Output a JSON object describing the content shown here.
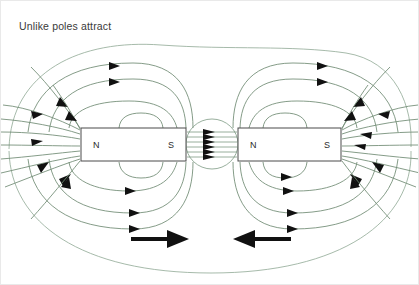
{
  "figure": {
    "title": "Unlike poles attract",
    "kind": "magnetic-field-line-diagram",
    "background_color": "#ffffff",
    "border_color": "#e9e9e9"
  },
  "colors": {
    "field_line": "#6f8a72",
    "field_line_pale": "#8fa894",
    "magnet_outline": "#4a4a4a",
    "magnet_fill": "#ffffff",
    "label_text": "#2b2b2b",
    "title_text": "#3a3a3a",
    "arrow_black": "#111111"
  },
  "magnets": [
    {
      "id": "left-magnet",
      "left_pole": "N",
      "right_pole": "S",
      "x": 80,
      "y": 127,
      "width": 105,
      "height": 33
    },
    {
      "id": "right-magnet",
      "left_pole": "N",
      "right_pole": "S",
      "x": 237,
      "y": 127,
      "width": 103,
      "height": 33
    }
  ],
  "gap": {
    "description": "field lines crossing from N of right magnet to S of left magnet",
    "line_count": 6,
    "arrow_direction": "left",
    "x_start": 185,
    "x_end": 237
  },
  "force_arrows": [
    {
      "id": "left-force-arrow",
      "direction": "right",
      "x1": 130,
      "x2": 186,
      "y": 238
    },
    {
      "id": "right-force-arrow",
      "direction": "left",
      "x1": 290,
      "x2": 234,
      "y": 238
    }
  ],
  "legend": {
    "field_arrow_note": "arrowheads show field direction: out of N, into S"
  }
}
